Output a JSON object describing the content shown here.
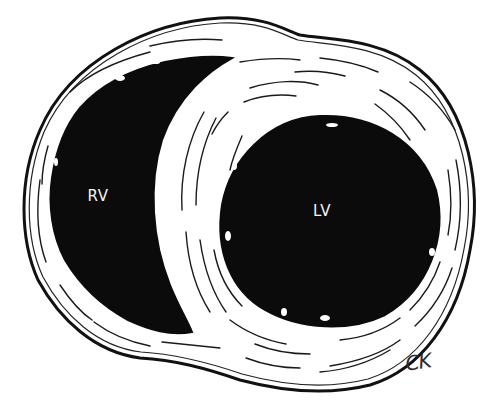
{
  "figure": {
    "type": "illustration",
    "background": "#ffffff",
    "ink_color": "#111111",
    "labels": {
      "right_ventricle": {
        "text": "RV",
        "x": 98,
        "y": 196
      },
      "left_ventricle": {
        "text": "LV",
        "x": 322,
        "y": 211
      }
    },
    "signature": {
      "text": "CK",
      "x": 418,
      "y": 362
    }
  }
}
